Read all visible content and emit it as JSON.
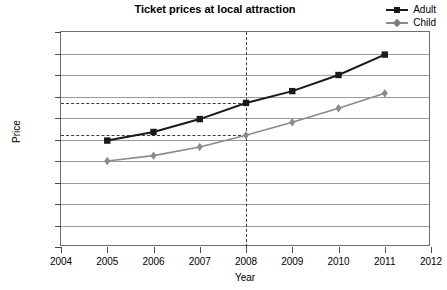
{
  "chart_data": {
    "type": "line",
    "title": "Ticket prices at local attraction",
    "xlabel": "Year",
    "ylabel": "Price",
    "x": [
      2005,
      2006,
      2007,
      2008,
      2009,
      2010,
      2011
    ],
    "xlim": [
      2004,
      2012
    ],
    "ylim": [
      0,
      10
    ],
    "xticks": [
      2004,
      2005,
      2006,
      2007,
      2008,
      2009,
      2010,
      2011,
      2012
    ],
    "xtick_labels": [
      "2004",
      "2005",
      "2006",
      "2007",
      "2008",
      "2009",
      "2010",
      "2011",
      "2012"
    ],
    "yticks": [
      0,
      1,
      2,
      3,
      4,
      5,
      6,
      7,
      8,
      9,
      10
    ],
    "ytick_labels": [
      "£0.00",
      "£1.00",
      "£2.00",
      "£3.00",
      "£4.00",
      "£5.00",
      "£6.00",
      "£7.00",
      "£8.00",
      "£9.00",
      "£10.00"
    ],
    "grid": true,
    "grid_axis": "y",
    "legend_position": "top-right",
    "series": [
      {
        "name": "Adult",
        "color": "#1a1a1a",
        "marker": "square",
        "values": [
          4.95,
          5.35,
          5.95,
          6.7,
          7.25,
          8.0,
          8.95
        ]
      },
      {
        "name": "Child",
        "color": "#8a8a8a",
        "marker": "diamond",
        "values": [
          4.0,
          4.25,
          4.65,
          5.2,
          5.8,
          6.45,
          7.15
        ]
      }
    ],
    "annotations": [
      {
        "type": "hline",
        "value": 6.7,
        "x_end": 2008,
        "style": "dashed",
        "series": "Adult"
      },
      {
        "type": "hline",
        "value": 5.2,
        "x_end": 2008,
        "style": "dashed",
        "series": "Child"
      },
      {
        "type": "vline",
        "value": 2008,
        "style": "dashed"
      }
    ]
  },
  "legend": {
    "items": [
      {
        "label": "Adult"
      },
      {
        "label": "Child"
      }
    ]
  }
}
